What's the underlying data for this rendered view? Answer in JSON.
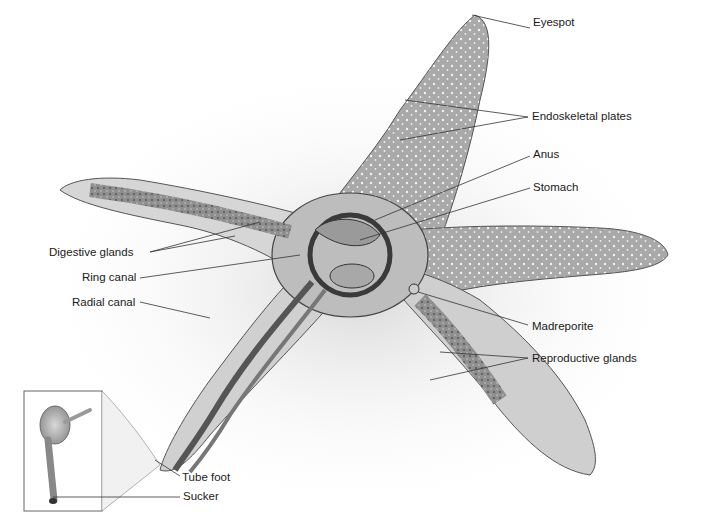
{
  "diagram": {
    "labels": [
      {
        "id": "eyespot",
        "text": "Eyespot",
        "x": 533,
        "y": 23,
        "anchor": "left"
      },
      {
        "id": "endoskeletal-plates",
        "text": "Endoskeletal plates",
        "x": 532,
        "y": 112,
        "anchor": "left"
      },
      {
        "id": "anus",
        "text": "Anus",
        "x": 533,
        "y": 151,
        "anchor": "left"
      },
      {
        "id": "stomach",
        "text": "Stomach",
        "x": 533,
        "y": 183,
        "anchor": "left"
      },
      {
        "id": "digestive-glands",
        "text": "Digestive glands",
        "x": 49,
        "y": 248,
        "anchor": "left"
      },
      {
        "id": "ring-canal",
        "text": "Ring canal",
        "x": 82,
        "y": 275,
        "anchor": "left"
      },
      {
        "id": "radial-canal",
        "text": "Radial canal",
        "x": 72,
        "y": 299,
        "anchor": "left"
      },
      {
        "id": "madreporite",
        "text": "Madreporite",
        "x": 532,
        "y": 321,
        "anchor": "left"
      },
      {
        "id": "reproductive-glands",
        "text": "Reproductive glands",
        "x": 532,
        "y": 354,
        "anchor": "left"
      },
      {
        "id": "tube-foot",
        "text": "Tube foot",
        "x": 182,
        "y": 473,
        "anchor": "left"
      },
      {
        "id": "sucker",
        "text": "Sucker",
        "x": 183,
        "y": 492,
        "anchor": "left"
      }
    ],
    "inset": {
      "title": "Tube foot detail",
      "x": 24,
      "y": 391,
      "width": 78,
      "height": 120
    }
  }
}
